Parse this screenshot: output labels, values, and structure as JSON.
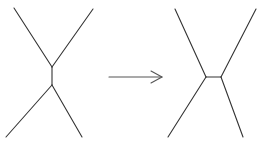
{
  "diagram": {
    "colors": {
      "edge": "#333333",
      "arrow": "#555555",
      "background": "#ffffff"
    },
    "before": {
      "nodes": {
        "top": [
          52,
          67
        ],
        "bottom": [
          52,
          85
        ]
      },
      "internal_edge": [
        [
          52,
          67
        ],
        [
          52,
          85
        ]
      ],
      "leaves": [
        [
          [
            52,
            67
          ],
          [
            14,
            8
          ]
        ],
        [
          [
            52,
            67
          ],
          [
            93,
            9
          ]
        ],
        [
          [
            52,
            85
          ],
          [
            6,
            137
          ]
        ],
        [
          [
            52,
            85
          ],
          [
            82,
            137
          ]
        ]
      ]
    },
    "arrow": {
      "from": [
        109,
        77
      ],
      "to": [
        162,
        77
      ],
      "head_upper": [
        151,
        71
      ],
      "head_lower": [
        151,
        83
      ]
    },
    "after": {
      "nodes": {
        "left": [
          206,
          77
        ],
        "right": [
          221,
          77
        ]
      },
      "internal_edge": [
        [
          206,
          77
        ],
        [
          221,
          77
        ]
      ],
      "leaves": [
        [
          [
            206,
            77
          ],
          [
            175,
            9
          ]
        ],
        [
          [
            221,
            77
          ],
          [
            256,
            9
          ]
        ],
        [
          [
            206,
            77
          ],
          [
            168,
            137
          ]
        ],
        [
          [
            221,
            77
          ],
          [
            243,
            137
          ]
        ]
      ]
    }
  }
}
